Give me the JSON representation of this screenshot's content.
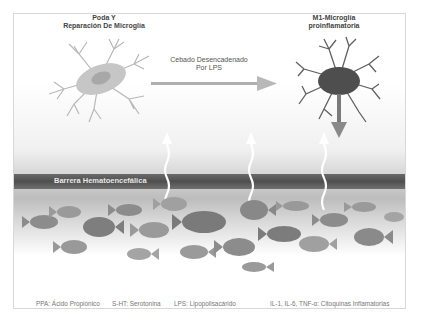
{
  "diagram": {
    "left_cell": {
      "line1": "Poda Y",
      "line2": "Reparación De Microglía"
    },
    "arrow_label": {
      "line1": "Cebado Desencadenado",
      "line2": "Por LPS"
    },
    "right_cell": {
      "line1": "M1-Microglía",
      "line2": "proinflamatoria"
    },
    "barrier_label": "Barrera Hematoencefálica",
    "legend": [
      "PPA: Ácido Propiónico",
      "S-HT: Serotonina",
      "LPS: Lipopolisacárido",
      "IL-1, IL-6, TNF-α: Citoquinas Inflamatorias"
    ],
    "colors": {
      "arrow": "#b0b0b0",
      "barrier": "#555555",
      "fish": "#8a8a8a",
      "cell_dark": "#555555",
      "cell_light": "#c8c8c8"
    }
  }
}
